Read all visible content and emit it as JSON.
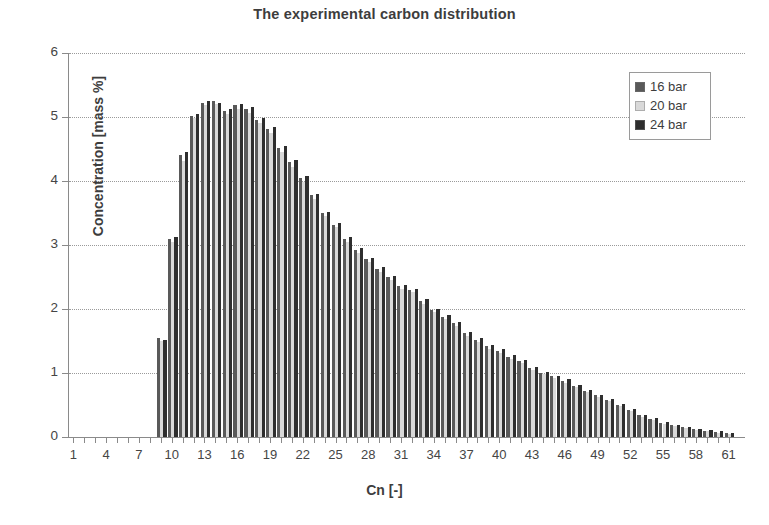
{
  "chart_data": {
    "type": "bar",
    "title": "The experimental carbon distribution",
    "xlabel": "Cn [-]",
    "ylabel": "Concentration [mass %]",
    "xlim": [
      1,
      61
    ],
    "ylim": [
      0,
      6
    ],
    "ytick_values": [
      0,
      1,
      2,
      3,
      4,
      5,
      6
    ],
    "xtick_labels": [
      "1",
      "4",
      "7",
      "10",
      "13",
      "16",
      "19",
      "22",
      "25",
      "28",
      "31",
      "34",
      "37",
      "40",
      "43",
      "46",
      "49",
      "52",
      "55",
      "58",
      "61"
    ],
    "xtick_step": 3,
    "grid": "horizontal-dotted",
    "legend_position": "top-right",
    "categories": [
      1,
      2,
      3,
      4,
      5,
      6,
      7,
      8,
      9,
      10,
      11,
      12,
      13,
      14,
      15,
      16,
      17,
      18,
      19,
      20,
      21,
      22,
      23,
      24,
      25,
      26,
      27,
      28,
      29,
      30,
      31,
      32,
      33,
      34,
      35,
      36,
      37,
      38,
      39,
      40,
      41,
      42,
      43,
      44,
      45,
      46,
      47,
      48,
      49,
      50,
      51,
      52,
      53,
      54,
      55,
      56,
      57,
      58,
      59,
      60,
      61
    ],
    "series": [
      {
        "name": "16 bar",
        "color": "#595959",
        "values": [
          0,
          0,
          0,
          0,
          0,
          0,
          0,
          0,
          1.55,
          3.1,
          4.4,
          5.02,
          5.22,
          5.25,
          5.1,
          5.18,
          5.12,
          4.95,
          4.82,
          4.52,
          4.3,
          4.05,
          3.78,
          3.5,
          3.32,
          3.1,
          2.92,
          2.78,
          2.62,
          2.5,
          2.36,
          2.3,
          2.12,
          1.98,
          1.88,
          1.78,
          1.62,
          1.52,
          1.42,
          1.35,
          1.25,
          1.18,
          1.08,
          1.0,
          0.95,
          0.88,
          0.8,
          0.72,
          0.65,
          0.58,
          0.5,
          0.42,
          0.34,
          0.28,
          0.22,
          0.18,
          0.15,
          0.12,
          0.1,
          0.08,
          0.06
        ]
      },
      {
        "name": "20 bar",
        "color": "#d9d9d9",
        "values": [
          0,
          0,
          0,
          0,
          0,
          0,
          0,
          0,
          1.5,
          3.05,
          4.32,
          4.98,
          5.18,
          5.2,
          5.05,
          5.12,
          5.06,
          4.9,
          4.75,
          4.45,
          4.22,
          3.98,
          3.72,
          3.45,
          3.28,
          3.05,
          2.88,
          2.74,
          2.58,
          2.46,
          2.32,
          2.26,
          2.08,
          1.95,
          1.85,
          1.74,
          1.58,
          1.48,
          1.38,
          1.32,
          1.22,
          1.15,
          1.05,
          0.98,
          0.92,
          0.85,
          0.78,
          0.7,
          0.62,
          0.56,
          0.48,
          0.4,
          0.32,
          0.26,
          0.2,
          0.17,
          0.14,
          0.11,
          0.09,
          0.07,
          0.05
        ]
      },
      {
        "name": "24 bar",
        "color": "#2e2e2e",
        "values": [
          0,
          0,
          0,
          0,
          0,
          0,
          0,
          0,
          1.52,
          3.12,
          4.45,
          5.05,
          5.25,
          5.22,
          5.12,
          5.2,
          5.15,
          4.98,
          4.85,
          4.55,
          4.33,
          4.08,
          3.8,
          3.52,
          3.35,
          3.12,
          2.95,
          2.8,
          2.65,
          2.52,
          2.38,
          2.32,
          2.15,
          2.0,
          1.9,
          1.8,
          1.64,
          1.54,
          1.44,
          1.38,
          1.28,
          1.2,
          1.1,
          1.02,
          0.96,
          0.9,
          0.82,
          0.74,
          0.66,
          0.6,
          0.52,
          0.44,
          0.35,
          0.29,
          0.23,
          0.19,
          0.16,
          0.13,
          0.11,
          0.09,
          0.07
        ]
      }
    ]
  },
  "legend": {
    "items": [
      {
        "label": "16 bar",
        "color": "#595959"
      },
      {
        "label": "20 bar",
        "color": "#d9d9d9"
      },
      {
        "label": "24 bar",
        "color": "#2e2e2e"
      }
    ]
  }
}
